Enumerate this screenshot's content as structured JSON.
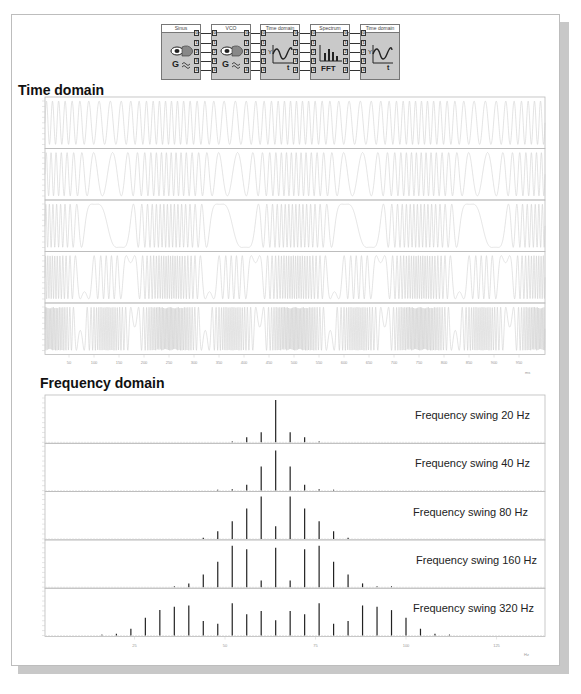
{
  "blocks": [
    {
      "label": "Sinus",
      "icon": "generator-icon",
      "x": 161
    },
    {
      "label": "VCO",
      "icon": "generator-icon",
      "x": 211
    },
    {
      "label": "Time domain",
      "icon": "time-domain-scope-icon",
      "x": 260
    },
    {
      "label": "Spectrum",
      "icon": "fft-spectrum-icon",
      "x": 310
    },
    {
      "label": "Time domain",
      "icon": "time-domain-scope-icon",
      "x": 360
    }
  ],
  "port_labels": [
    "0",
    "1",
    "2",
    "3",
    "4"
  ],
  "fft_label": "FFT",
  "time_section": {
    "title": "Time domain",
    "x_ticks": [
      "50",
      "100",
      "150",
      "200",
      "250",
      "300",
      "350",
      "400",
      "450",
      "500",
      "550",
      "600",
      "650",
      "700",
      "750",
      "800",
      "850",
      "900",
      "950"
    ],
    "x_unit": "ms"
  },
  "freq_section": {
    "title": "Frequency  domain",
    "x_ticks": [
      "25",
      "50",
      "75",
      "100",
      "125"
    ],
    "x_unit": "Hz",
    "swing_labels": [
      "Frequency swing 20 Hz",
      "Frequency swing 40 Hz",
      "Frequency swing 80 Hz",
      "Frequency swing 160 Hz",
      "Frequency swing 320 Hz"
    ]
  },
  "chart_data": [
    {
      "type": "line",
      "title": "Time domain",
      "xlabel": "ms",
      "xlim": [
        0,
        1000
      ],
      "x_ticks": [
        50,
        100,
        150,
        200,
        250,
        300,
        350,
        400,
        450,
        500,
        550,
        600,
        650,
        700,
        750,
        800,
        850,
        900,
        950
      ],
      "ylim": [
        -8,
        8
      ],
      "panels": [
        {
          "name": "FM signal, swing 20 Hz",
          "carrier_hz": 64,
          "swing_hz": 20,
          "mod_hz": 4
        },
        {
          "name": "FM signal, swing 40 Hz",
          "carrier_hz": 64,
          "swing_hz": 40,
          "mod_hz": 4
        },
        {
          "name": "FM signal, swing 80 Hz",
          "carrier_hz": 64,
          "swing_hz": 80,
          "mod_hz": 4
        },
        {
          "name": "FM signal, swing 160 Hz",
          "carrier_hz": 64,
          "swing_hz": 160,
          "mod_hz": 4
        },
        {
          "name": "FM signal, swing 320 Hz",
          "carrier_hz": 64,
          "swing_hz": 320,
          "mod_hz": 4
        }
      ]
    },
    {
      "type": "bar",
      "title": "Frequency domain",
      "xlabel": "Hz",
      "xlim": [
        0,
        135
      ],
      "x_ticks": [
        25,
        50,
        75,
        100,
        125
      ],
      "series": [
        {
          "name": "Frequency swing 20 Hz",
          "x": [
            52,
            56,
            60,
            64,
            68,
            72,
            76
          ],
          "values": [
            0.01,
            0.12,
            0.24,
            1.0,
            0.24,
            0.12,
            0.01
          ]
        },
        {
          "name": "Frequency swing 40 Hz",
          "x": [
            48,
            52,
            56,
            60,
            64,
            68,
            72,
            76,
            80
          ],
          "values": [
            0.01,
            0.03,
            0.14,
            0.57,
            0.95,
            0.57,
            0.14,
            0.03,
            0.01
          ]
        },
        {
          "name": "Frequency swing 80 Hz",
          "x": [
            44,
            48,
            52,
            56,
            60,
            64,
            68,
            72,
            76,
            80,
            84
          ],
          "values": [
            0.03,
            0.18,
            0.42,
            0.72,
            1.0,
            0.3,
            1.0,
            0.72,
            0.42,
            0.18,
            0.03
          ]
        },
        {
          "name": "Frequency swing 160 Hz",
          "x": [
            36,
            40,
            44,
            48,
            52,
            56,
            60,
            64,
            68,
            72,
            76,
            80,
            84,
            88,
            92,
            96
          ],
          "values": [
            0.02,
            0.09,
            0.3,
            0.6,
            0.98,
            0.9,
            0.16,
            0.93,
            0.16,
            0.9,
            0.98,
            0.6,
            0.3,
            0.09,
            0.02,
            0.0
          ]
        },
        {
          "name": "Frequency swing 320 Hz",
          "x": [
            16,
            20,
            24,
            28,
            32,
            36,
            40,
            44,
            48,
            52,
            56,
            60,
            64,
            68,
            72,
            76,
            80,
            84,
            88,
            92,
            96,
            100,
            104,
            108,
            112
          ],
          "values": [
            0.01,
            0.04,
            0.16,
            0.42,
            0.6,
            0.68,
            0.71,
            0.34,
            0.28,
            0.76,
            0.5,
            0.58,
            0.36,
            0.58,
            0.5,
            0.76,
            0.28,
            0.34,
            0.71,
            0.68,
            0.6,
            0.42,
            0.16,
            0.04,
            0.01
          ]
        }
      ]
    }
  ]
}
